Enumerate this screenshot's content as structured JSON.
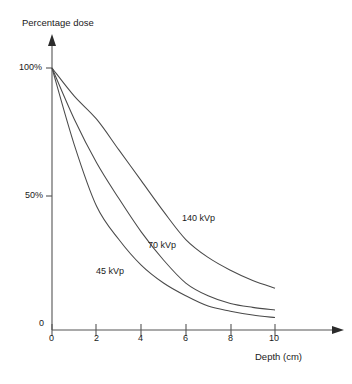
{
  "chart_data": {
    "type": "line",
    "title": "",
    "xlabel": "Depth (cm)",
    "ylabel": "Percentage dose",
    "xlim": [
      0,
      10
    ],
    "ylim": [
      0,
      100
    ],
    "grid": false,
    "legend_position": "inline-curve-labels",
    "x_ticks": [
      "0",
      "2",
      "4",
      "6",
      "8",
      "10"
    ],
    "x_tick_values": [
      0,
      2,
      4,
      6,
      8,
      10
    ],
    "y_ticks": [
      "0",
      "50%",
      "100%"
    ],
    "y_tick_values": [
      0,
      50,
      100
    ],
    "x": [
      0,
      1,
      2,
      3,
      4,
      5,
      6,
      7,
      8,
      9,
      10
    ],
    "series": [
      {
        "name": "140 kVp",
        "label": "140 kVp",
        "values": [
          100,
          89,
          80,
          68,
          56,
          44,
          33,
          26,
          21,
          17,
          14
        ]
      },
      {
        "name": "70 kVp",
        "label": "70 kVp",
        "values": [
          100,
          80,
          63,
          49,
          36,
          25,
          16,
          11,
          8,
          6.5,
          5.5
        ]
      },
      {
        "name": "45 kVp",
        "label": "45 kVp",
        "values": [
          100,
          70,
          46,
          33,
          23,
          16,
          11,
          7,
          5,
          3.5,
          2.5
        ]
      }
    ]
  },
  "axes": {
    "y_title": "Percentage dose",
    "x_title": "Depth (cm)",
    "y_labels": {
      "top": "100%",
      "mid": "50%",
      "zero": "0"
    },
    "x_labels": {
      "t0": "0",
      "t2": "2",
      "t4": "4",
      "t6": "6",
      "t8": "8",
      "t10": "10"
    }
  },
  "curve_labels": {
    "high": "140 kVp",
    "mid": "70 kVp",
    "low": "45 kVp"
  },
  "colors": {
    "background": "#ffffff",
    "axis": "#555555",
    "curve": "#4a4a4a",
    "text": "#1a1a1a"
  }
}
